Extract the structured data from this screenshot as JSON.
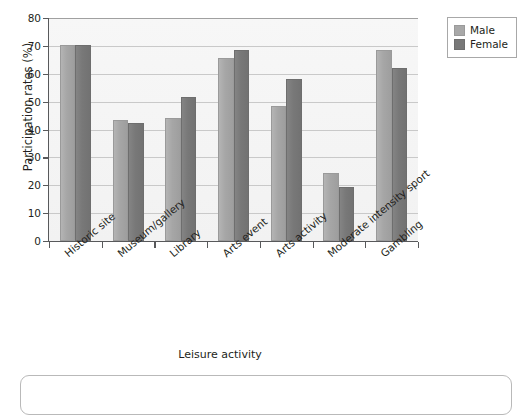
{
  "chart_data": {
    "type": "bar",
    "title": "",
    "xlabel": "Leisure activity",
    "ylabel": "Participation rates (%)",
    "ylim": [
      0,
      80
    ],
    "ytick_step": 10,
    "yticks": [
      "0",
      "10",
      "20",
      "30",
      "40",
      "50",
      "60",
      "70",
      "80"
    ],
    "grid": "horizontal",
    "legend_position": "top-right",
    "categories": [
      "Historic site",
      "Museum/gallery",
      "Library",
      "Arts event",
      "Arts activity",
      "Moderate intensity sport",
      "Gambling"
    ],
    "series": [
      {
        "name": "Male",
        "color": "#a8a8a8",
        "values": [
          70.3,
          43.3,
          44.2,
          65.5,
          48.3,
          24.5,
          68.7
        ]
      },
      {
        "name": "Female",
        "color": "#787878",
        "values": [
          70.3,
          42.5,
          51.8,
          68.5,
          58.2,
          19.3,
          62.0
        ]
      }
    ]
  },
  "legend": {
    "items": [
      {
        "label": "Male",
        "swatch": "male"
      },
      {
        "label": "Female",
        "swatch": "female"
      }
    ]
  },
  "axes": {
    "y_title": "Participation rates (%)",
    "x_title": "Leisure activity"
  }
}
